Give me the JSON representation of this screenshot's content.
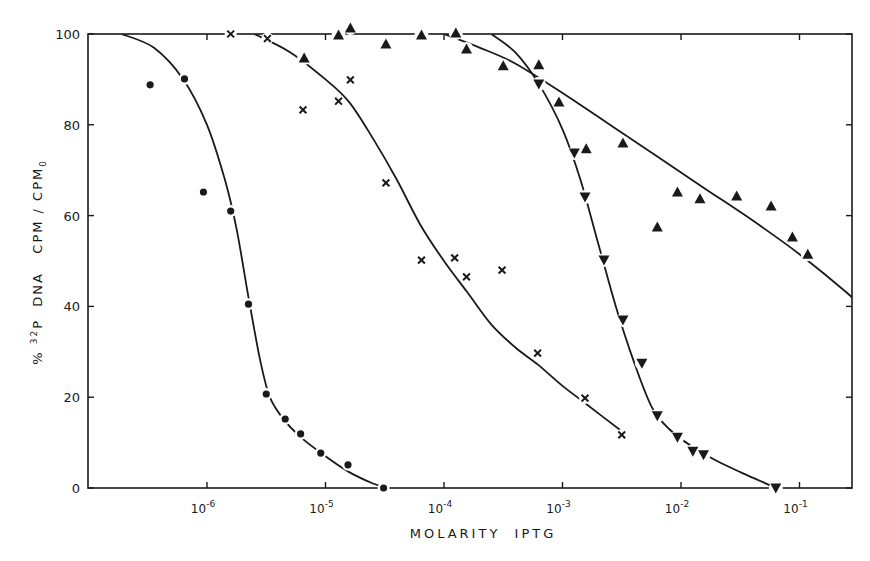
{
  "chart_data": {
    "type": "scatter",
    "title": "",
    "xlabel": "MOLARITY  IPTG",
    "ylabel": "% 32P DNA  CPM / CPM0",
    "ylabel_parts": {
      "prefix": "% ",
      "sup": "32",
      "mid": "P  DNA   CPM / CPM",
      "sub": "0"
    },
    "x_scale": "log10",
    "xlim_log10": [
      -7.0,
      -0.6
    ],
    "ylim": [
      0,
      100
    ],
    "x_ticks": [
      {
        "log": -6,
        "base": "10",
        "exp": "-6"
      },
      {
        "log": -5,
        "base": "10",
        "exp": "-5"
      },
      {
        "log": -4,
        "base": "10",
        "exp": "-4"
      },
      {
        "log": -3,
        "base": "10",
        "exp": "-3"
      },
      {
        "log": -2,
        "base": "10",
        "exp": "-2"
      },
      {
        "log": -1,
        "base": "10",
        "exp": "-1"
      }
    ],
    "y_ticks": [
      0,
      20,
      40,
      60,
      80,
      100
    ],
    "grid": false,
    "legend": null,
    "series": [
      {
        "name": "circles",
        "marker": "circle",
        "points_log10x": [
          [
            -6.48,
            88.8
          ],
          [
            -6.19,
            90.1
          ],
          [
            -6.03,
            65.2
          ],
          [
            -5.8,
            61.0
          ],
          [
            -5.65,
            40.5
          ],
          [
            -5.5,
            20.7
          ],
          [
            -5.34,
            15.2
          ],
          [
            -5.21,
            11.9
          ],
          [
            -5.04,
            7.7
          ],
          [
            -4.81,
            5.1
          ],
          [
            -4.51,
            0.0
          ]
        ],
        "curve_log10x": [
          [
            -6.72,
            100
          ],
          [
            -6.45,
            97
          ],
          [
            -6.2,
            90
          ],
          [
            -6.0,
            80
          ],
          [
            -5.85,
            68
          ],
          [
            -5.75,
            57
          ],
          [
            -5.65,
            42
          ],
          [
            -5.55,
            28
          ],
          [
            -5.47,
            20
          ],
          [
            -5.35,
            15
          ],
          [
            -5.2,
            11
          ],
          [
            -5.0,
            7
          ],
          [
            -4.8,
            3.5
          ],
          [
            -4.6,
            1
          ],
          [
            -4.48,
            0
          ]
        ]
      },
      {
        "name": "crosses",
        "marker": "x",
        "points_log10x": [
          [
            -5.8,
            100.0
          ],
          [
            -5.49,
            99.0
          ],
          [
            -5.19,
            83.3
          ],
          [
            -4.89,
            85.2
          ],
          [
            -4.79,
            89.9
          ],
          [
            -4.49,
            67.2
          ],
          [
            -4.19,
            50.2
          ],
          [
            -3.91,
            50.7
          ],
          [
            -3.81,
            46.5
          ],
          [
            -3.51,
            48.0
          ],
          [
            -3.21,
            29.7
          ],
          [
            -2.81,
            19.8
          ],
          [
            -2.5,
            11.7
          ]
        ],
        "curve_log10x": [
          [
            -5.6,
            100
          ],
          [
            -5.3,
            96
          ],
          [
            -5.0,
            90
          ],
          [
            -4.8,
            85
          ],
          [
            -4.6,
            77
          ],
          [
            -4.4,
            68
          ],
          [
            -4.2,
            58
          ],
          [
            -4.0,
            50
          ],
          [
            -3.8,
            43
          ],
          [
            -3.6,
            36
          ],
          [
            -3.4,
            31
          ],
          [
            -3.2,
            27
          ],
          [
            -3.0,
            22.5
          ],
          [
            -2.8,
            18.5
          ],
          [
            -2.5,
            12.5
          ]
        ]
      },
      {
        "name": "upright-triangles",
        "marker": "triangle-up",
        "points_log10x": [
          [
            -5.18,
            94.7
          ],
          [
            -4.89,
            99.8
          ],
          [
            -4.79,
            101.3
          ],
          [
            -4.49,
            97.8
          ],
          [
            -4.19,
            99.8
          ],
          [
            -3.9,
            100.2
          ],
          [
            -3.81,
            96.7
          ],
          [
            -3.5,
            93.0
          ],
          [
            -3.2,
            93.2
          ],
          [
            -3.03,
            85.0
          ],
          [
            -2.8,
            74.7
          ],
          [
            -2.49,
            76.0
          ],
          [
            -2.2,
            57.5
          ],
          [
            -2.03,
            65.2
          ],
          [
            -1.84,
            63.7
          ],
          [
            -1.53,
            64.3
          ],
          [
            -1.24,
            62.1
          ],
          [
            -1.06,
            55.3
          ],
          [
            -0.93,
            51.5
          ]
        ],
        "curve_log10x": [
          [
            -4.0,
            100
          ],
          [
            -3.7,
            97
          ],
          [
            -3.4,
            93.5
          ],
          [
            -3.0,
            87
          ],
          [
            -2.6,
            80
          ],
          [
            -2.2,
            73
          ],
          [
            -1.8,
            66
          ],
          [
            -1.4,
            59
          ],
          [
            -1.0,
            51.5
          ],
          [
            -0.6,
            43
          ],
          [
            -0.55,
            41.5
          ]
        ]
      },
      {
        "name": "inverted-triangles",
        "marker": "triangle-down",
        "points_log10x": [
          [
            -3.2,
            89.0
          ],
          [
            -2.9,
            73.8
          ],
          [
            -2.81,
            64.1
          ],
          [
            -2.65,
            50.2
          ],
          [
            -2.49,
            37.0
          ],
          [
            -2.33,
            27.5
          ],
          [
            -2.2,
            15.9
          ],
          [
            -2.03,
            11.2
          ],
          [
            -1.9,
            8.1
          ],
          [
            -1.81,
            7.3
          ],
          [
            -1.2,
            0.0
          ]
        ],
        "curve_log10x": [
          [
            -3.6,
            100
          ],
          [
            -3.4,
            96
          ],
          [
            -3.2,
            89
          ],
          [
            -3.0,
            79
          ],
          [
            -2.85,
            68
          ],
          [
            -2.7,
            54
          ],
          [
            -2.55,
            40
          ],
          [
            -2.4,
            28
          ],
          [
            -2.25,
            18
          ],
          [
            -2.1,
            13
          ],
          [
            -1.9,
            9
          ],
          [
            -1.7,
            6
          ],
          [
            -1.5,
            3.5
          ],
          [
            -1.3,
            1.2
          ],
          [
            -1.2,
            0
          ]
        ]
      }
    ]
  }
}
